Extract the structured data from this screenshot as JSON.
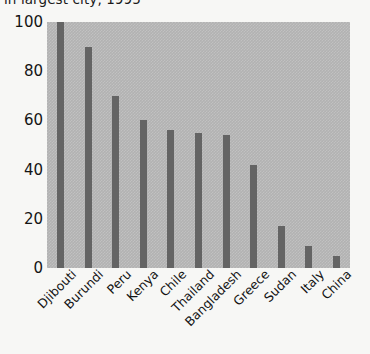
{
  "chart_data": {
    "type": "bar",
    "title": "in largest city, 1995",
    "title_clipped": true,
    "xlabel": "",
    "ylabel": "",
    "ylim": [
      0,
      100
    ],
    "yticks": [
      0,
      20,
      40,
      60,
      80,
      100
    ],
    "ytick_labels": [
      "0",
      "20",
      "40",
      "60",
      "80",
      "100"
    ],
    "grid": false,
    "legend": false,
    "categories": [
      "Djibouti",
      "Burundi",
      "Peru",
      "Kenya",
      "Chile",
      "Thailand",
      "Bangladesh",
      "Greece",
      "Sudan",
      "Italy",
      "China"
    ],
    "values": [
      100,
      90,
      70,
      60,
      56,
      55,
      54,
      42,
      17,
      9,
      5
    ],
    "bar_color": "#646464",
    "plot_background": "#b2b2b2",
    "figure_background": "#f7f7f5"
  },
  "axis": {
    "y_ticks": [
      "100",
      "80",
      "60",
      "40",
      "20",
      "0"
    ]
  }
}
